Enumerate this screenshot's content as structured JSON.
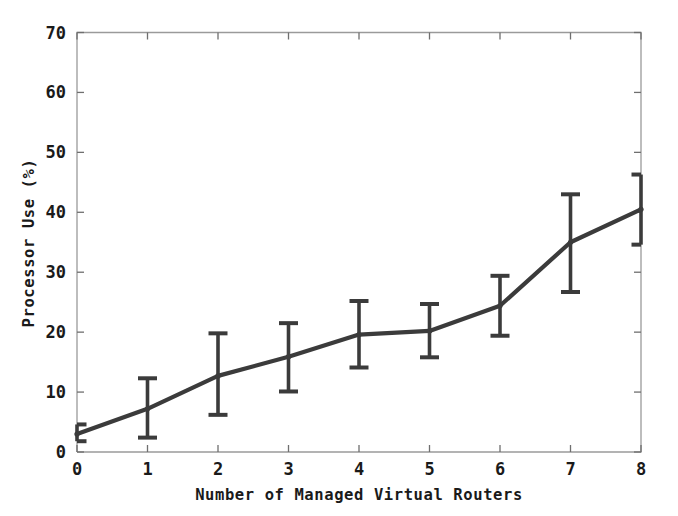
{
  "chart_data": {
    "type": "line",
    "title": "",
    "subtitle": "",
    "xlabel": "Number of Managed Virtual Routers",
    "ylabel": "Processor Use (%)",
    "xlim": [
      0,
      8
    ],
    "ylim": [
      0,
      70
    ],
    "xticks": [
      0,
      1,
      2,
      3,
      4,
      5,
      6,
      7,
      8
    ],
    "yticks": [
      0,
      10,
      20,
      30,
      40,
      50,
      60,
      70
    ],
    "xtick_labels": [
      "0",
      "1",
      "2",
      "3",
      "4",
      "5",
      "6",
      "7",
      "8"
    ],
    "ytick_labels": [
      "0",
      "10",
      "20",
      "30",
      "40",
      "50",
      "60",
      "70"
    ],
    "grid": false,
    "legend": false,
    "legend_position": "none",
    "error_bars": true,
    "line_color": "#3b3b3b",
    "frame_color": "#9a9a9a",
    "background_color": "#ffffff",
    "x": [
      0,
      1,
      2,
      3,
      4,
      5,
      6,
      7,
      8
    ],
    "values": [
      3.0,
      7.2,
      12.7,
      15.9,
      19.6,
      20.2,
      24.4,
      35.0,
      40.5
    ],
    "err_low": [
      1.8,
      2.4,
      6.2,
      10.1,
      14.1,
      15.8,
      19.4,
      26.7,
      34.6
    ],
    "err_high": [
      4.6,
      12.3,
      19.8,
      21.5,
      25.2,
      24.7,
      29.4,
      43.0,
      46.3
    ],
    "series": [
      {
        "name": "Processor Use",
        "values": [
          3.0,
          7.2,
          12.7,
          15.9,
          19.6,
          20.2,
          24.4,
          35.0,
          40.5
        ]
      }
    ]
  }
}
